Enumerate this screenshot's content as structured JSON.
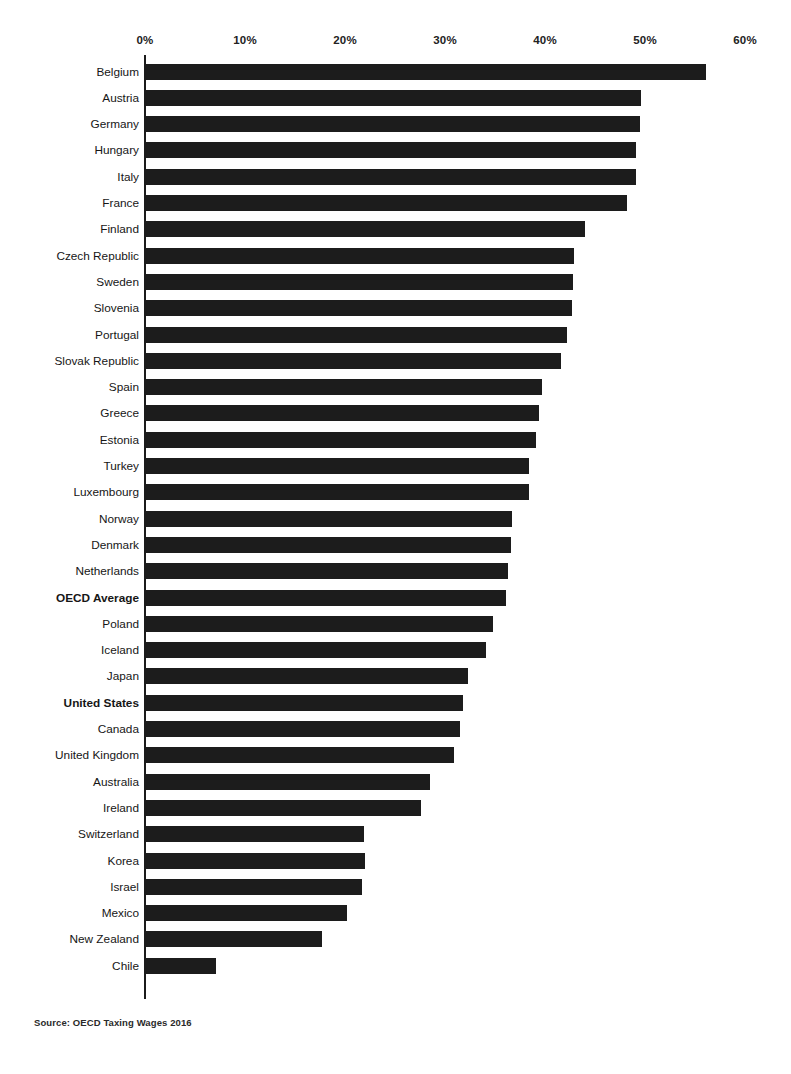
{
  "chart_data": {
    "type": "bar",
    "orientation": "horizontal",
    "title": "",
    "subtitle": "",
    "xlabel": "",
    "ylabel": "",
    "xlim": [
      0,
      60
    ],
    "xticks": [
      0,
      10,
      20,
      30,
      40,
      50,
      60
    ],
    "xtick_labels": [
      "0%",
      "10%",
      "20%",
      "30%",
      "40%",
      "50%",
      "60%"
    ],
    "grid": false,
    "legend": null,
    "bar_color": "#1c1c1c",
    "axis_color": "#1b1b1b",
    "categories": [
      "Belgium",
      "Austria",
      "Germany",
      "Hungary",
      "Italy",
      "France",
      "Finland",
      "Czech Republic",
      "Sweden",
      "Slovenia",
      "Portugal",
      "Slovak Republic",
      "Spain",
      "Greece",
      "Estonia",
      "Turkey",
      "Luxembourg",
      "Norway",
      "Denmark",
      "Netherlands",
      "OECD Average",
      "Poland",
      "Iceland",
      "Japan",
      "United States",
      "Canada",
      "United Kingdom",
      "Australia",
      "Ireland",
      "Switzerland",
      "Korea",
      "Israel",
      "Mexico",
      "New Zealand",
      "Chile"
    ],
    "values": [
      56.0,
      49.5,
      49.4,
      49.0,
      49.0,
      48.1,
      43.9,
      42.8,
      42.7,
      42.6,
      42.1,
      41.5,
      39.6,
      39.3,
      39.0,
      38.3,
      38.3,
      36.6,
      36.5,
      36.2,
      36.0,
      34.7,
      34.0,
      32.2,
      31.7,
      31.4,
      30.8,
      28.4,
      27.5,
      21.8,
      21.9,
      21.6,
      20.1,
      17.6,
      7.0
    ],
    "highlighted_categories": [
      "OECD Average",
      "United States"
    ],
    "annotations": []
  },
  "footer": {
    "source": "Source: OECD Taxing Wages 2016"
  }
}
